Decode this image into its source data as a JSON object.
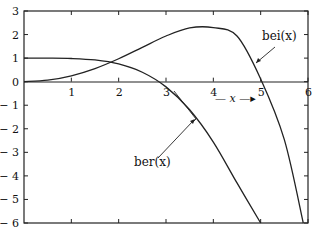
{
  "chart_data": {
    "type": "line",
    "title": "",
    "xlabel": "x",
    "ylabel": "",
    "xlim": [
      0,
      6
    ],
    "ylim": [
      -6,
      3
    ],
    "grid": false,
    "x_ticks": [
      "1",
      "2",
      "3",
      "4",
      "5",
      "6"
    ],
    "y_ticks": [
      "3",
      "2",
      "1",
      "0",
      "-1",
      "-2",
      "-3",
      "-4",
      "-5",
      "-6"
    ],
    "series": [
      {
        "name": "ber(x)",
        "x": [
          0,
          0.5,
          1,
          1.5,
          2,
          2.5,
          3,
          3.5,
          4,
          4.5,
          5
        ],
        "values": [
          1.0,
          0.999,
          0.984,
          0.921,
          0.751,
          0.4,
          -0.221,
          -1.194,
          -2.563,
          -4.299,
          -6.23
        ]
      },
      {
        "name": "bei(x)",
        "x": [
          0,
          0.5,
          1,
          1.5,
          2,
          2.5,
          3,
          3.5,
          4,
          4.5,
          5,
          5.5,
          5.9
        ],
        "values": [
          0.0,
          0.0625,
          0.25,
          0.556,
          0.972,
          1.457,
          1.938,
          2.283,
          2.293,
          1.939,
          0.116,
          -2.46,
          -6.0
        ]
      }
    ],
    "annotations": [
      {
        "text": "bei(x)",
        "points_to": "bei curve near x=4.85"
      },
      {
        "text": "ber(x)",
        "points_to": "ber curve near x=3.5"
      },
      {
        "text": "— x →",
        "position": "below x-axis between 4 and 5"
      }
    ]
  },
  "labels": {
    "bei": "bei(x)",
    "ber": "ber(x)",
    "x_arrow": "— x —▸"
  }
}
